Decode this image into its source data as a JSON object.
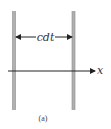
{
  "diagram": {
    "distance_label": "cdt",
    "axis_label": "x",
    "caption": "(a)",
    "colors": {
      "plate": "#a8a8a8",
      "plate_edge": "#7a7a7a",
      "line": "#222222"
    }
  }
}
